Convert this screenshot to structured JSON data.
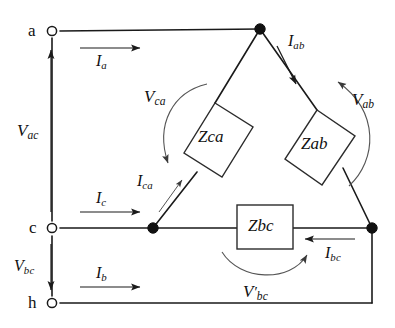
{
  "diagram": {
    "terminals": [
      {
        "id": "a",
        "label": "a",
        "x": 52,
        "y": 31
      },
      {
        "id": "c",
        "label": "c",
        "x": 52,
        "y": 228
      },
      {
        "id": "h",
        "label": "h",
        "x": 52,
        "y": 303
      }
    ],
    "impedances": [
      {
        "id": "z_ca",
        "base": "Z",
        "sub": "ca",
        "shape": "tilted-rect"
      },
      {
        "id": "z_ab",
        "base": "Z",
        "sub": "ab",
        "shape": "tilted-rect"
      },
      {
        "id": "z_bc",
        "base": "Z",
        "sub": "bc",
        "shape": "rect"
      }
    ],
    "currents": [
      {
        "id": "i_a",
        "base": "I",
        "sub": "a",
        "direction": "right"
      },
      {
        "id": "i_c",
        "base": "I",
        "sub": "c",
        "direction": "right"
      },
      {
        "id": "i_b",
        "base": "I",
        "sub": "b",
        "direction": "right"
      },
      {
        "id": "i_ab",
        "base": "I",
        "sub": "ab",
        "direction": "down-left"
      },
      {
        "id": "i_bc",
        "base": "I",
        "sub": "bc",
        "direction": "left"
      },
      {
        "id": "i_ca",
        "base": "I",
        "sub": "ca",
        "direction": "up-right"
      }
    ],
    "voltages": [
      {
        "id": "v_ac",
        "base": "V",
        "sub": "ac",
        "prime": "",
        "direction": "up"
      },
      {
        "id": "v_bc",
        "base": "V",
        "sub": "bc",
        "prime": "",
        "direction": "down"
      },
      {
        "id": "v_ca",
        "base": "V",
        "sub": "ca",
        "prime": "",
        "direction": "arc-down"
      },
      {
        "id": "v_ab",
        "base": "V",
        "sub": "ab",
        "prime": "",
        "direction": "arc-up"
      },
      {
        "id": "v_bc_prime",
        "base": "V",
        "sub": "bc",
        "prime": "′",
        "direction": "arc-right"
      }
    ],
    "colors": {
      "line": "#1a1a1a",
      "thin_line": "#555555",
      "background": "#ffffff",
      "node_fill": "#111111"
    }
  }
}
